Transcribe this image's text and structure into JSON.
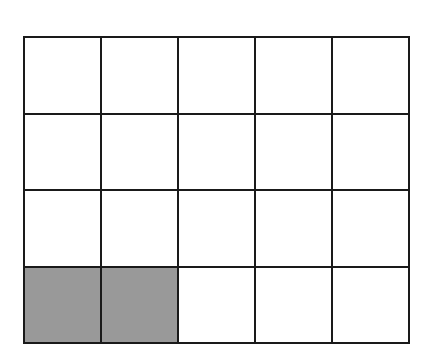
{
  "diagram": {
    "type": "grid",
    "rows": 4,
    "columns": 5,
    "total_cells": 20,
    "shaded_cells": 2,
    "shade_color": "#999999",
    "shaded_positions": [
      [
        3,
        0
      ],
      [
        3,
        1
      ]
    ],
    "fraction_shaded": "2/20"
  }
}
